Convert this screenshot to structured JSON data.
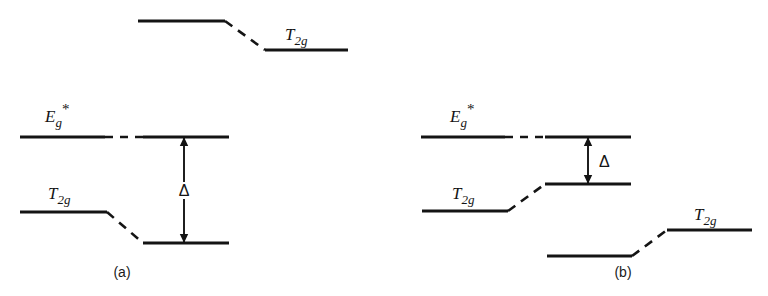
{
  "figure": {
    "kind": "energy-level-diagram",
    "background_color": "#ffffff",
    "line_color": "#141414",
    "width": 768,
    "height": 296
  },
  "panels": [
    {
      "id": "a",
      "caption": "(a)",
      "caption_x": 122,
      "caption_y": 277,
      "levels": [
        {
          "id": "a-top-t2g",
          "label": "T",
          "sub": "2g",
          "star": "",
          "label_x": 285,
          "label_y": 40,
          "left_segment": {
            "x1": 138,
            "y1": 21,
            "x2": 225,
            "y2": 21
          },
          "connector": {
            "x1": 225,
            "y1": 21,
            "x2": 265,
            "y2": 50
          },
          "right_segment": {
            "x1": 265,
            "y1": 50,
            "x2": 348,
            "y2": 50
          },
          "has_gap_dash": false
        },
        {
          "id": "a-eg-star",
          "label": "E",
          "sub": "g",
          "star": "*",
          "label_x": 45,
          "label_y": 122,
          "left_segment": {
            "x1": 20,
            "y1": 137,
            "x2": 105,
            "y2": 137
          },
          "connector": {
            "x1": 105,
            "y1": 137,
            "x2": 143,
            "y2": 137
          },
          "right_segment": {
            "x1": 143,
            "y1": 137,
            "x2": 229,
            "y2": 137
          },
          "has_gap_dash": true
        },
        {
          "id": "a-t2g",
          "label": "T",
          "sub": "2g",
          "star": "",
          "label_x": 48,
          "label_y": 199,
          "left_segment": {
            "x1": 20,
            "y1": 212,
            "x2": 107,
            "y2": 212
          },
          "connector": {
            "x1": 107,
            "y1": 212,
            "x2": 143,
            "y2": 243
          },
          "right_segment": {
            "x1": 143,
            "y1": 243,
            "x2": 229,
            "y2": 243
          },
          "has_gap_dash": false
        }
      ],
      "splitting_arrow": {
        "symbol": "Δ",
        "x": 184,
        "y_top": 137,
        "y_bottom": 243,
        "label_x": 184,
        "label_y": 196,
        "label_placement": "on-shaft"
      }
    },
    {
      "id": "b",
      "caption": "(b)",
      "caption_x": 623,
      "caption_y": 277,
      "levels": [
        {
          "id": "b-eg-star",
          "label": "E",
          "sub": "g",
          "star": "*",
          "label_x": 450,
          "label_y": 122,
          "left_segment": {
            "x1": 421,
            "y1": 137,
            "x2": 505,
            "y2": 137
          },
          "connector": {
            "x1": 505,
            "y1": 137,
            "x2": 545,
            "y2": 137
          },
          "right_segment": {
            "x1": 545,
            "y1": 137,
            "x2": 631,
            "y2": 137
          },
          "has_gap_dash": true
        },
        {
          "id": "b-t2g",
          "label": "T",
          "sub": "2g",
          "star": "",
          "label_x": 452,
          "label_y": 199,
          "left_segment": {
            "x1": 422,
            "y1": 211,
            "x2": 508,
            "y2": 211
          },
          "connector": {
            "x1": 508,
            "y1": 211,
            "x2": 545,
            "y2": 184
          },
          "right_segment": {
            "x1": 545,
            "y1": 184,
            "x2": 631,
            "y2": 184
          },
          "has_gap_dash": false
        },
        {
          "id": "b-lower-t2g",
          "label": "T",
          "sub": "2g",
          "star": "",
          "label_x": 694,
          "label_y": 220,
          "left_segment": {
            "x1": 547,
            "y1": 256,
            "x2": 632,
            "y2": 256
          },
          "connector": {
            "x1": 632,
            "y1": 256,
            "x2": 667,
            "y2": 230
          },
          "right_segment": {
            "x1": 667,
            "y1": 230,
            "x2": 752,
            "y2": 230
          },
          "has_gap_dash": false
        }
      ],
      "splitting_arrow": {
        "symbol": "Δ",
        "x": 588,
        "y_top": 137,
        "y_bottom": 184,
        "label_x": 599,
        "label_y": 167,
        "label_placement": "right-of-shaft"
      }
    }
  ]
}
